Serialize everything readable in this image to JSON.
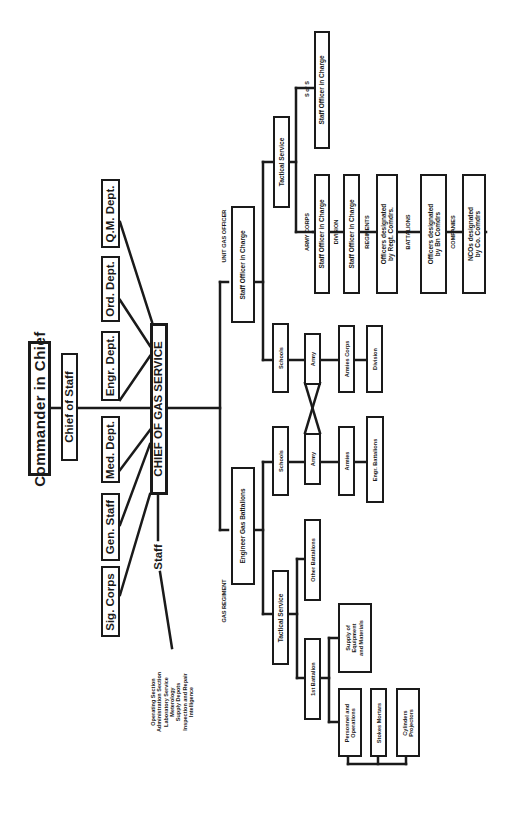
{
  "chart": {
    "orientation": "rotated-90-ccw",
    "line_color": "#1a1a1a",
    "top": {
      "commander": "Commander in Chief",
      "chief_of_staff": "Chief of Staff",
      "chief_gas_service": "CHIEF OF GAS SERVICE",
      "staff_label": "Staff"
    },
    "departments": [
      {
        "label": "Q.M. Dept."
      },
      {
        "label": "Ord. Dept."
      },
      {
        "label": "Engr. Dept."
      },
      {
        "label": "Med. Dept."
      },
      {
        "label": "Gen. Staff"
      },
      {
        "label": "Sig. Corps"
      }
    ],
    "staff_sections": [
      "Operating Section",
      "Administration Section",
      "Laboratory Service",
      "Meterology",
      "Supply Depots",
      "Inspection and Repair",
      "Intelligence"
    ],
    "unit_gas_officer": {
      "heading": "UNIT GAS OFFICER",
      "box": "Staff Officer in Charge",
      "schools": "Schools",
      "army": "Army",
      "armies_corps": "Armies Corps",
      "division": "Division",
      "tactical_service": "Tactical Service",
      "s_of_s": "S of S",
      "s_of_s_box": "Staff Officer in Charge",
      "chain": [
        {
          "level": "ARMY CORPS",
          "box": "Staff Officer in Charge"
        },
        {
          "level": "DIVISION",
          "box": "Staff Officer in Charge"
        },
        {
          "level": "REGIMENTS",
          "box": "Officers designated\nby Regt. Comdrs."
        },
        {
          "level": "BATTALIONS",
          "box": "Officers designated\nby Bn Comdrs"
        },
        {
          "level": "COMPANIES",
          "box": "NCOs designated\nby Co. Comdrs"
        }
      ]
    },
    "gas_regiment": {
      "heading": "GAS REGIMENT",
      "box": "Engineer Gas Battalions",
      "schools": "Schools",
      "army": "Army",
      "armies": "Armies",
      "engr_battalions": "Engr. Battalions",
      "tactical_service": "Tactical Service",
      "other_battalions": "Other Battalions",
      "first_battalion": "1st Battalion",
      "supply": "Supply of\nEquipment\nand Materials",
      "personnel": "Personnel and\nOperations",
      "stokes": "Stokes Mortars",
      "cylinders": "Cylinders\nProjectors"
    }
  }
}
